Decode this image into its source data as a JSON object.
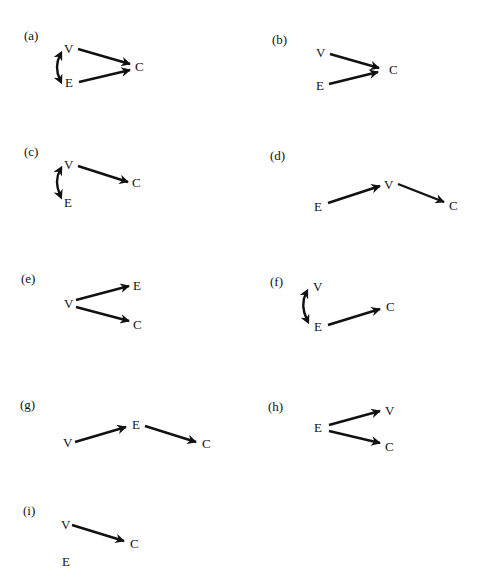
{
  "figure": {
    "panels": [
      {
        "id": "a",
        "label": "(a)",
        "nodes": {
          "V": "V",
          "E": "E",
          "C": "C"
        },
        "edges": [
          {
            "from": "V",
            "to": "C",
            "type": "directed"
          },
          {
            "from": "E",
            "to": "C",
            "type": "directed"
          },
          {
            "from": "V",
            "to": "E",
            "type": "bidirected-curved"
          }
        ]
      },
      {
        "id": "b",
        "label": "(b)",
        "nodes": {
          "V": "V",
          "E": "E",
          "C": "C"
        },
        "edges": [
          {
            "from": "V",
            "to": "C",
            "type": "directed"
          },
          {
            "from": "E",
            "to": "C",
            "type": "directed"
          }
        ]
      },
      {
        "id": "c",
        "label": "(c)",
        "nodes": {
          "V": "V",
          "E": "E",
          "C": "C"
        },
        "edges": [
          {
            "from": "V",
            "to": "C",
            "type": "directed"
          },
          {
            "from": "V",
            "to": "E",
            "type": "bidirected-curved"
          }
        ]
      },
      {
        "id": "d",
        "label": "(d)",
        "nodes": {
          "E": "E",
          "V": "V",
          "C": "C"
        },
        "edges": [
          {
            "from": "E",
            "to": "V",
            "type": "directed"
          },
          {
            "from": "V",
            "to": "C",
            "type": "directed"
          }
        ]
      },
      {
        "id": "e",
        "label": "(e)",
        "nodes": {
          "V": "V",
          "E": "E",
          "C": "C"
        },
        "edges": [
          {
            "from": "V",
            "to": "E",
            "type": "directed"
          },
          {
            "from": "V",
            "to": "C",
            "type": "directed"
          }
        ]
      },
      {
        "id": "f",
        "label": "(f)",
        "nodes": {
          "V": "V",
          "E": "E",
          "C": "C"
        },
        "edges": [
          {
            "from": "E",
            "to": "C",
            "type": "directed"
          },
          {
            "from": "V",
            "to": "E",
            "type": "bidirected-curved"
          }
        ]
      },
      {
        "id": "g",
        "label": "(g)",
        "nodes": {
          "V": "V",
          "E": "E",
          "C": "C"
        },
        "edges": [
          {
            "from": "V",
            "to": "E",
            "type": "directed"
          },
          {
            "from": "E",
            "to": "C",
            "type": "directed"
          }
        ]
      },
      {
        "id": "h",
        "label": "(h)",
        "nodes": {
          "E": "E",
          "V": "V",
          "C": "C"
        },
        "edges": [
          {
            "from": "E",
            "to": "V",
            "type": "directed"
          },
          {
            "from": "E",
            "to": "C",
            "type": "directed"
          }
        ]
      },
      {
        "id": "i",
        "label": "(i)",
        "nodes": {
          "V": "V",
          "E": "E",
          "C": "C"
        },
        "edges": [
          {
            "from": "V",
            "to": "C",
            "type": "directed"
          }
        ]
      }
    ]
  },
  "colors": {
    "ink": "#111111",
    "background": "#ffffff"
  }
}
